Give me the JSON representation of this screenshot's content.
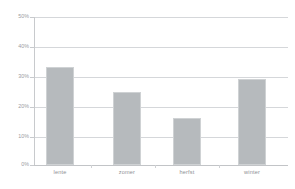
{
  "chart_data": {
    "type": "bar",
    "title": "",
    "xlabel": "",
    "ylabel": "",
    "categories": [
      "lente",
      "zomer",
      "herfst",
      "winter"
    ],
    "values": [
      33,
      24.5,
      16,
      29
    ],
    "ylim": [
      0,
      50
    ],
    "ytick_labels": [
      "50%",
      "40%",
      "30%",
      "20%",
      "10%",
      "0%"
    ],
    "ytick_values": [
      50,
      40,
      30,
      20,
      10,
      0
    ],
    "grid": true,
    "legend": "none",
    "bar_color": "#b6babd",
    "gridline_color": "#d5d7da",
    "text_color": "#9a9c9f",
    "background": "#ffffff"
  }
}
